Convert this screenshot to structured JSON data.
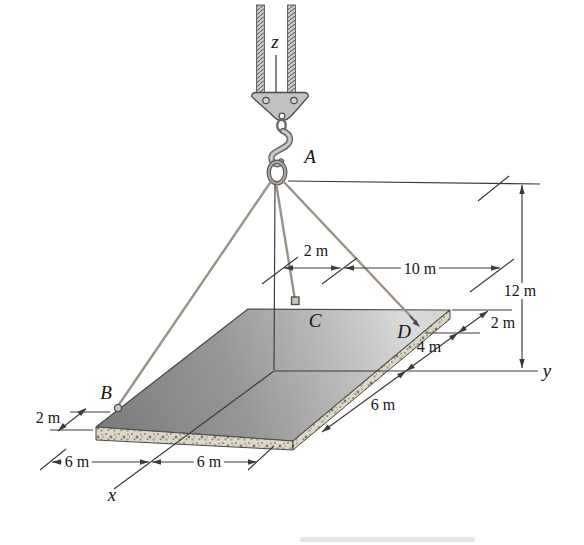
{
  "figure": {
    "points": {
      "A": "A",
      "B": "B",
      "C": "C",
      "D": "D"
    },
    "axes": {
      "x": "x",
      "y": "y",
      "z": "z"
    },
    "dims": {
      "c_offset": "2 m",
      "c_to_edge": "10 m",
      "height": "12 m",
      "edge_top": "2 m",
      "edge_mid": "4 m",
      "edge_bottom": "6 m",
      "b_offset": "2 m",
      "front_left": "6 m",
      "front_right": "6 m"
    },
    "colors": {
      "plate_dark": "#7f7f7f",
      "plate_light": "#dadada",
      "concrete": "#ddd8ca",
      "cable": "#9b9186",
      "line": "#3a3a3a",
      "background": "#ffffff"
    }
  }
}
